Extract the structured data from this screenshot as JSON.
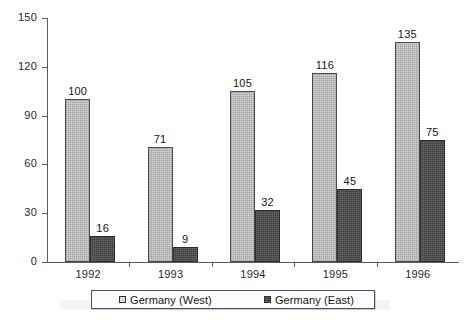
{
  "chart_data": {
    "type": "bar",
    "title": "",
    "xlabel": "",
    "ylabel": "",
    "categories": [
      "1992",
      "1993",
      "1994",
      "1995",
      "1996"
    ],
    "series": [
      {
        "name": "Germany (West)",
        "values": [
          100,
          71,
          105,
          116,
          135
        ],
        "color": "#d4d4d4"
      },
      {
        "name": "Germany (East)",
        "values": [
          16,
          9,
          32,
          45,
          75
        ],
        "color": "#3d3d3d"
      }
    ],
    "ylim": [
      0,
      150
    ],
    "yticks": [
      0,
      30,
      60,
      90,
      120,
      150
    ],
    "ytick_labels": [
      "0",
      "30",
      "60",
      "90",
      "120",
      "150"
    ],
    "grid": false,
    "data_labels": true,
    "legend_position": "bottom"
  },
  "legend": {
    "entries": [
      {
        "label": "Germany (West)",
        "marker": "hollow-square-marker"
      },
      {
        "label": "Germany (East)",
        "marker": "filled-square-marker"
      }
    ]
  }
}
